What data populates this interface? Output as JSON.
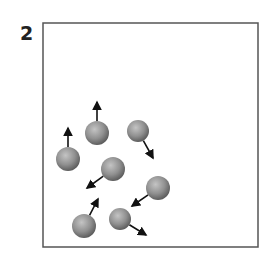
{
  "figure": {
    "panel_label": "2",
    "colors": {
      "box": "#555555",
      "particle": "#8f8f8f",
      "arrow": "#111111"
    },
    "box": {
      "x": 43,
      "y": 23,
      "width": 215,
      "height": 224
    },
    "particles": [
      {
        "cx": 68,
        "cy": 159,
        "r": 12,
        "arrow_to": [
          68,
          128
        ]
      },
      {
        "cx": 97,
        "cy": 133,
        "r": 12,
        "arrow_to": [
          97,
          102
        ]
      },
      {
        "cx": 138,
        "cy": 131,
        "r": 11,
        "arrow_to": [
          153,
          158
        ]
      },
      {
        "cx": 113,
        "cy": 169,
        "r": 12,
        "arrow_to": [
          87,
          188
        ]
      },
      {
        "cx": 158,
        "cy": 188,
        "r": 12,
        "arrow_to": [
          132,
          206
        ]
      },
      {
        "cx": 84,
        "cy": 226,
        "r": 12,
        "arrow_to": [
          98,
          199
        ]
      },
      {
        "cx": 120,
        "cy": 219,
        "r": 11,
        "arrow_to": [
          146,
          235
        ]
      }
    ]
  }
}
